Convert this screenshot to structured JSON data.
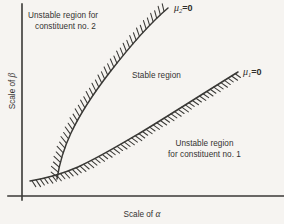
{
  "figure": {
    "background_color": "#f6f4f1",
    "line_color": "#3a3936",
    "text_color": "#333230"
  },
  "axes": {
    "y_label_prefix": "Scale of ",
    "y_label_symbol": "β",
    "x_label_prefix": "Scale of ",
    "x_label_symbol": "α"
  },
  "regions": {
    "unstable_2": {
      "line1": "Unstable region for",
      "line2": "constituent no. 2"
    },
    "stable": {
      "line1": "Stable region"
    },
    "unstable_1": {
      "line1": "Unstable region",
      "line2": "for constituent no. 1"
    }
  },
  "curves": {
    "mu2": {
      "symbol": "μ",
      "subscript": "2",
      "equals": "=0",
      "label_full": "μ₂=0",
      "hatch_side": "left"
    },
    "mu1": {
      "symbol": "μ",
      "subscript": "1",
      "equals": "=0",
      "label_full": "μ₁=0",
      "hatch_side": "below-right"
    }
  },
  "chart_data": {
    "type": "line",
    "title": "",
    "xlabel": "Scale of α",
    "ylabel": "Scale of β",
    "grid": false,
    "legend": "inline-annotations",
    "xlim": [
      0,
      284
    ],
    "ylim": [
      0,
      224
    ],
    "annotations": [
      {
        "text": "Unstable region for constituent no. 2",
        "x": 80,
        "y": 22
      },
      {
        "text": "Stable region",
        "x": 160,
        "y": 76
      },
      {
        "text": "Unstable region for constituent no. 1",
        "x": 205,
        "y": 150
      },
      {
        "text": "μ₂=0",
        "x": 186,
        "y": 9
      },
      {
        "text": "μ₁=0",
        "x": 256,
        "y": 73
      }
    ],
    "series": [
      {
        "name": "μ₂=0",
        "description": "steep boundary separating unstable region for constituent no. 2 (left) from stable region (right)",
        "points": [
          [
            57,
            178
          ],
          [
            61,
            160
          ],
          [
            67,
            141
          ],
          [
            76,
            120
          ],
          [
            88,
            99
          ],
          [
            102,
            79
          ],
          [
            119,
            57
          ],
          [
            137,
            36
          ],
          [
            153,
            20
          ],
          [
            168,
            8
          ]
        ]
      },
      {
        "name": "μ₁=0",
        "description": "shallow boundary separating stable region (above) from unstable region for constituent no. 1 (below)",
        "points": [
          [
            30,
            181
          ],
          [
            48,
            177
          ],
          [
            68,
            171
          ],
          [
            90,
            162
          ],
          [
            112,
            151
          ],
          [
            134,
            139
          ],
          [
            157,
            125
          ],
          [
            180,
            110
          ],
          [
            203,
            93
          ],
          [
            221,
            81
          ],
          [
            238,
            72
          ]
        ]
      }
    ]
  }
}
